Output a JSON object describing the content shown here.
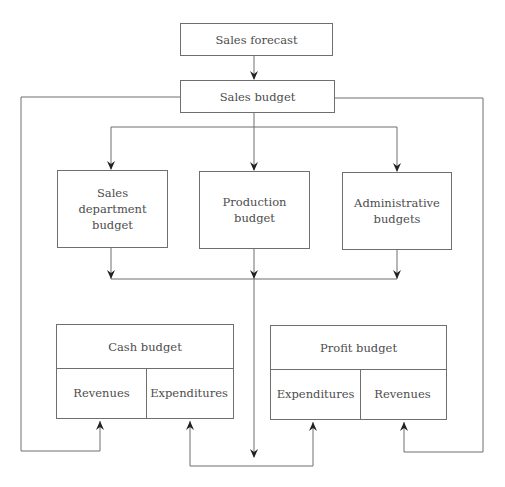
{
  "diagram": {
    "nodes": {
      "sales_forecast": "Sales forecast",
      "sales_budget": "Sales budget",
      "sales_department_budget": "Sales\ndepartment budget",
      "production_budget": "Production\nbudget",
      "administrative_budgets": "Administrative\nbudgets",
      "cash_budget": {
        "title": "Cash budget",
        "left": "Revenues",
        "right": "Expenditures"
      },
      "profit_budget": {
        "title": "Profit budget",
        "left": "Expenditures",
        "right": "Revenues"
      }
    },
    "edges": [
      {
        "from": "Sales forecast",
        "to": "Sales budget"
      },
      {
        "from": "Sales budget",
        "to": "Sales department budget"
      },
      {
        "from": "Sales budget",
        "to": "Production budget"
      },
      {
        "from": "Sales budget",
        "to": "Administrative budgets"
      },
      {
        "from": "Sales budget",
        "to": "Cash budget / Revenues"
      },
      {
        "from": "Sales budget",
        "to": "Profit budget / Revenues"
      },
      {
        "from": "Sales department budget",
        "to": "collector"
      },
      {
        "from": "Production budget",
        "to": "collector"
      },
      {
        "from": "Administrative budgets",
        "to": "collector"
      },
      {
        "from": "collector",
        "to": "Cash budget / Expenditures"
      },
      {
        "from": "collector",
        "to": "Profit budget / Expenditures"
      }
    ],
    "colors": {
      "line": "#6f6f6f",
      "text": "#4d4d4d",
      "background": "#ffffff"
    }
  }
}
